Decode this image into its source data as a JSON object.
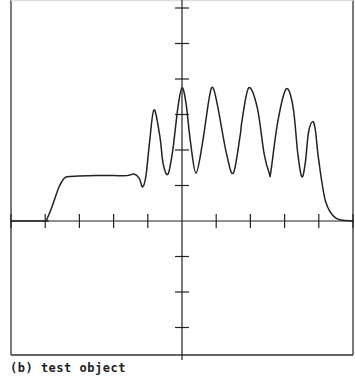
{
  "caption": "(b) test object",
  "chart_data": {
    "type": "line",
    "title": "",
    "caption": "(b) test object",
    "xlabel": "",
    "ylabel": "",
    "xlim": [
      -5,
      5
    ],
    "ylim": [
      -3.8,
      6.1
    ],
    "x_ticks": [
      -5,
      -4,
      -3,
      -2,
      -1,
      0,
      1,
      2,
      3,
      4,
      5
    ],
    "y_ticks": [
      -3,
      -2,
      -1,
      1,
      2,
      3,
      4,
      5,
      6
    ],
    "tick_labels_shown": false,
    "grid": false,
    "legend": null,
    "series": [
      {
        "name": "test object profile",
        "x": [
          -5.0,
          -4.0,
          -3.95,
          -3.8,
          -3.6,
          -3.45,
          -3.3,
          -3.0,
          -2.5,
          -2.0,
          -1.6,
          -1.4,
          -1.25,
          -1.15,
          -1.05,
          -0.95,
          -0.82,
          -0.65,
          -0.55,
          -0.41,
          -0.27,
          -0.12,
          0.0,
          0.12,
          0.25,
          0.41,
          0.6,
          0.8,
          0.91,
          1.05,
          1.3,
          1.5,
          1.7,
          1.75,
          1.95,
          2.2,
          2.4,
          2.55,
          2.6,
          2.8,
          3.05,
          3.25,
          3.38,
          3.5,
          3.6,
          3.7,
          3.82,
          3.9,
          4.0,
          4.2,
          4.5,
          5.0
        ],
        "y": [
          0.0,
          0.0,
          0.05,
          0.4,
          0.95,
          1.2,
          1.25,
          1.27,
          1.28,
          1.28,
          1.28,
          1.32,
          1.2,
          0.96,
          1.3,
          2.2,
          3.13,
          2.4,
          1.6,
          1.32,
          2.0,
          3.2,
          3.75,
          3.3,
          2.2,
          1.35,
          2.2,
          3.5,
          3.75,
          3.2,
          1.9,
          1.35,
          2.4,
          2.8,
          3.75,
          3.2,
          1.9,
          1.35,
          1.4,
          2.8,
          3.72,
          3.2,
          1.95,
          1.25,
          1.6,
          2.5,
          2.8,
          2.55,
          1.7,
          0.55,
          0.08,
          0.0
        ]
      }
    ]
  }
}
